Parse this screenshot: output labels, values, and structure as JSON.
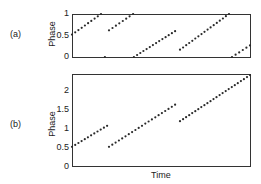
{
  "chart_data": [
    {
      "panel": "(a)",
      "type": "scatter",
      "title": "",
      "xlabel": "",
      "ylabel": "Phase",
      "yticks": [
        "0",
        "0.5",
        "1"
      ],
      "ylim": [
        0,
        1
      ],
      "xlim": [
        0,
        1
      ],
      "grid": false,
      "legend": null,
      "series": [
        {
          "name": "segment-1",
          "x": [
            0.0,
            0.163
          ],
          "y": [
            0.52,
            1.0
          ],
          "points": 10
        },
        {
          "name": "isolated-point",
          "x": [
            0.185
          ],
          "y": [
            0.0
          ],
          "points": 1
        },
        {
          "name": "segment-2",
          "x": [
            0.208,
            0.343
          ],
          "y": [
            0.62,
            1.0
          ],
          "points": 8
        },
        {
          "name": "segment-3",
          "x": [
            0.348,
            0.579
          ],
          "y": [
            0.0,
            0.6
          ],
          "points": 14
        },
        {
          "name": "segment-4",
          "x": [
            0.607,
            0.882
          ],
          "y": [
            0.17,
            1.0
          ],
          "points": 17
        },
        {
          "name": "segment-5",
          "x": [
            0.899,
            1.0
          ],
          "y": [
            0.0,
            0.27
          ],
          "points": 6
        }
      ]
    },
    {
      "panel": "(b)",
      "type": "scatter",
      "title": "",
      "xlabel": "Time",
      "ylabel": "Phase",
      "yticks": [
        "0",
        "0.5",
        "1",
        "1.5",
        "2"
      ],
      "ylim": [
        0,
        2.4
      ],
      "xlim": [
        0,
        1
      ],
      "grid": false,
      "legend": null,
      "series": [
        {
          "name": "segment-1",
          "x": [
            0.0,
            0.197
          ],
          "y": [
            0.5,
            1.05
          ],
          "points": 12
        },
        {
          "name": "segment-2",
          "x": [
            0.208,
            0.579
          ],
          "y": [
            0.5,
            1.6
          ],
          "points": 21
        },
        {
          "name": "segment-3",
          "x": [
            0.607,
            1.0
          ],
          "y": [
            1.17,
            2.37
          ],
          "points": 24
        }
      ]
    }
  ],
  "labels": {
    "panel_a": "(a)",
    "panel_b": "(b)",
    "ylabel_a": "Phase",
    "ylabel_b": "Phase",
    "xlabel_b": "Time",
    "ticks_a": [
      "1",
      "0.5",
      "0"
    ],
    "ticks_b": [
      "2",
      "1.5",
      "1",
      "0.5",
      "0"
    ]
  },
  "colors": {
    "marker": "#2a2a2a",
    "frame": "#333333",
    "text": "#222222"
  }
}
